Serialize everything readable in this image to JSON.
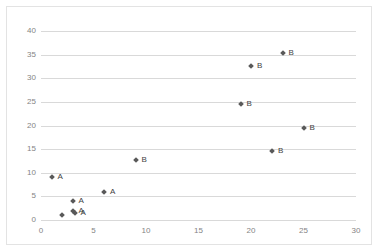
{
  "chart_data": {
    "type": "scatter",
    "title": "",
    "xlabel": "",
    "ylabel": "",
    "xlim": [
      0,
      30
    ],
    "ylim": [
      0,
      40
    ],
    "xticks": [
      0,
      5,
      10,
      15,
      20,
      25,
      30
    ],
    "yticks": [
      0,
      5,
      10,
      15,
      20,
      25,
      30,
      35,
      40
    ],
    "grid": "horizontal",
    "legend": "none",
    "marker_color": "#595959",
    "gridline_color": "#d9d9d9",
    "tick_label_color": "#848484",
    "series": [
      {
        "name": "A",
        "label": "A",
        "points": [
          {
            "x": 1.0,
            "y": 9.0,
            "label": "A"
          },
          {
            "x": 6.0,
            "y": 5.9,
            "label": "A"
          },
          {
            "x": 3.0,
            "y": 4.0,
            "label": "A"
          },
          {
            "x": 3.0,
            "y": 1.9,
            "label": "A"
          },
          {
            "x": 3.2,
            "y": 1.5,
            "label": "A"
          },
          {
            "x": 2.0,
            "y": 1.0,
            "label": ""
          }
        ]
      },
      {
        "name": "B",
        "label": "B",
        "points": [
          {
            "x": 9.0,
            "y": 12.8,
            "label": "B"
          },
          {
            "x": 19.0,
            "y": 24.6,
            "label": "B"
          },
          {
            "x": 20.0,
            "y": 32.5,
            "label": "B"
          },
          {
            "x": 22.0,
            "y": 14.5,
            "label": "B"
          },
          {
            "x": 23.0,
            "y": 35.4,
            "label": "B"
          },
          {
            "x": 25.0,
            "y": 19.4,
            "label": "B"
          }
        ]
      }
    ]
  }
}
